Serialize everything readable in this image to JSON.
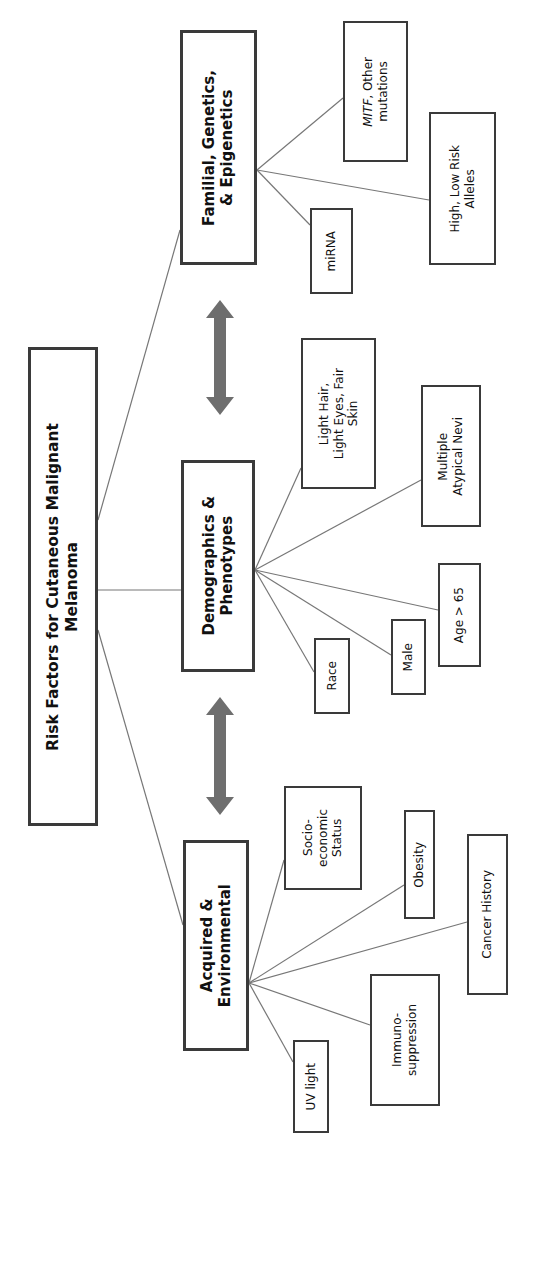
{
  "root": {
    "label": "Risk Factors for Cutaneous Malignant\nMelanoma"
  },
  "categories": [
    {
      "id": "familial",
      "label": "Familial, Genetics,\n& Epigenetics"
    },
    {
      "id": "demographics",
      "label": "Demographics &\nPhenotypes"
    },
    {
      "id": "acquired",
      "label": "Acquired &\nEnvironmental"
    }
  ],
  "leaves": {
    "familial": {
      "mitf_italic": "MITF",
      "mitf_rest": ", Other\nmutations",
      "alleles": "High, Low Risk\nAlleles",
      "mirna": "miRNA"
    },
    "demographics": {
      "light": "Light Hair,\nLight Eyes, Fair\nSkin",
      "nevi": "Multiple\nAtypical Nevi",
      "age": "Age > 65",
      "male": "Male",
      "race": "Race"
    },
    "acquired": {
      "socio": "Socio-\neconomic\nStatus",
      "obesity": "Obesity",
      "cancer": "Cancer History",
      "immuno": "Immuno-\nsuppression",
      "uv": "UV light"
    }
  },
  "colors": {
    "border": "#3a3a3a",
    "line": "#777777",
    "arrow": "#6e6e6e"
  }
}
